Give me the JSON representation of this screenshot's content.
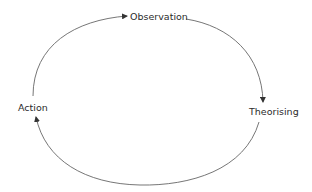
{
  "diagram": {
    "type": "cycle",
    "nodes": [
      {
        "id": "observation",
        "label": "Observation"
      },
      {
        "id": "theorising",
        "label": "Theorising"
      },
      {
        "id": "action",
        "label": "Action"
      }
    ],
    "edges": [
      {
        "from": "observation",
        "to": "theorising"
      },
      {
        "from": "theorising",
        "to": "action"
      },
      {
        "from": "action",
        "to": "observation"
      }
    ],
    "colors": {
      "line": "#555555",
      "text": "#2b2b2b",
      "background": "#ffffff"
    }
  }
}
